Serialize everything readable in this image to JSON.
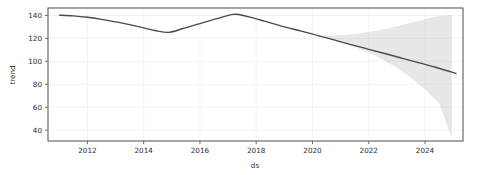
{
  "chart_data": {
    "type": "line",
    "title": "",
    "subtitle": "",
    "xlabel": "ds",
    "ylabel": "trend",
    "grid": true,
    "legend": null,
    "xlim": [
      2010.6,
      2025.35
    ],
    "ylim": [
      30.5,
      146.5
    ],
    "xticks": [
      2012,
      2014,
      2016,
      2018,
      2020,
      2022,
      2024
    ],
    "xticklabels": [
      "2012",
      "2014",
      "2016",
      "2018",
      "2020",
      "2022",
      "2024"
    ],
    "yticks": [
      40,
      60,
      80,
      100,
      120,
      140
    ],
    "yticklabels": [
      "40",
      "60",
      "80",
      "100",
      "120",
      "140"
    ],
    "series": [
      {
        "name": "trend",
        "color": "#4a4a4a",
        "x": [
          2011.0,
          2011.5,
          2012.0,
          2012.5,
          2013.0,
          2013.5,
          2014.0,
          2014.4,
          2014.9,
          2015.4,
          2016.0,
          2016.6,
          2017.2,
          2017.7,
          2018.3,
          2019.0,
          2019.6,
          2020.2,
          2020.8,
          2021.4,
          2022.0,
          2022.6,
          2023.2,
          2023.8,
          2024.4,
          2025.1
        ],
        "values": [
          140.3,
          139.6,
          138.4,
          136.6,
          134.4,
          132.0,
          129.2,
          126.9,
          125.3,
          128.6,
          132.9,
          137.2,
          141.0,
          139.0,
          135.0,
          130.0,
          126.4,
          122.4,
          118.4,
          114.4,
          110.5,
          106.6,
          102.6,
          98.6,
          94.6,
          89.4
        ]
      }
    ],
    "uncertainty_band": {
      "name": "trend uncertainty interval",
      "color": "#b8b8b8",
      "opacity": 0.34,
      "x": [
        2020.1,
        2020.5,
        2021.0,
        2021.5,
        2022.0,
        2022.5,
        2023.0,
        2023.5,
        2024.0,
        2024.5,
        2024.95
      ],
      "upper": [
        122.8,
        122.4,
        122.8,
        123.8,
        125.6,
        127.8,
        130.6,
        133.6,
        136.8,
        139.6,
        140.6
      ],
      "lower": [
        122.2,
        120.2,
        116.6,
        112.4,
        107.4,
        101.4,
        94.2,
        85.6,
        75.6,
        63.4,
        33.2
      ]
    },
    "annotations": []
  }
}
